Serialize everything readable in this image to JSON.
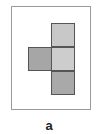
{
  "figure": {
    "label": "a",
    "frame_color": "#9a9a9a",
    "cells": [
      {
        "name": "top",
        "left": 51,
        "top": 23,
        "fill": "#c8c8c8"
      },
      {
        "name": "middle-left",
        "left": 28,
        "top": 47,
        "fill": "#a6a6a6"
      },
      {
        "name": "middle",
        "left": 51,
        "top": 47,
        "fill": "#cdcdcd"
      },
      {
        "name": "bottom",
        "left": 51,
        "top": 71,
        "fill": "#a9a9a9"
      }
    ]
  }
}
